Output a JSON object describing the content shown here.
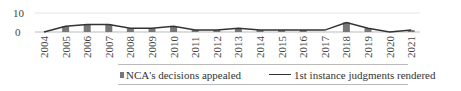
{
  "chart_data": {
    "type": "bar",
    "title": "",
    "xlabel": "",
    "ylabel": "",
    "ylim": [
      0,
      10
    ],
    "yticks": [
      0,
      10
    ],
    "grid": true,
    "legend_position": "bottom",
    "categories": [
      "2004",
      "2005",
      "2006",
      "2007",
      "2008",
      "2009",
      "2010",
      "2011",
      "2012",
      "2013",
      "2014",
      "2015",
      "2016",
      "2017",
      "2018",
      "2019",
      "2020",
      "2021"
    ],
    "series": [
      {
        "name": "NCA's decisions appealed",
        "type": "bar",
        "color": "#777777",
        "values": [
          0,
          3,
          4,
          4,
          2,
          2,
          3,
          1,
          1,
          2,
          1,
          1,
          1,
          0,
          5,
          2,
          0,
          1
        ]
      },
      {
        "name": "1st instance judgments rendered",
        "type": "line",
        "color": "#333333",
        "values": [
          0,
          3,
          4,
          4,
          2,
          2,
          3,
          1,
          1,
          2,
          1,
          1,
          1,
          1,
          5,
          2,
          0,
          1
        ]
      }
    ]
  },
  "legend": {
    "bar_label": "NCA's decisions appealed",
    "line_label": "1st instance judgments rendered"
  },
  "y_axis": {
    "tick_top": "10",
    "tick_bottom": "0"
  }
}
